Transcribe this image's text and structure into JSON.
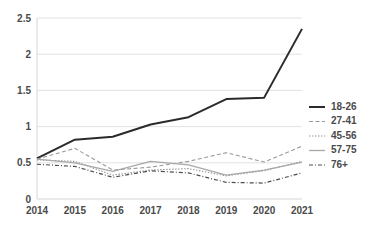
{
  "chart_data": {
    "type": "line",
    "title": "",
    "subtitle": "",
    "xlabel": "",
    "ylabel": "",
    "categories": [
      "2014",
      "2015",
      "2016",
      "2017",
      "2018",
      "2019",
      "2020",
      "2021"
    ],
    "x": [
      2014,
      2015,
      2016,
      2017,
      2018,
      2019,
      2020,
      2021
    ],
    "ylim": [
      0,
      2.5
    ],
    "yticks": [
      "0",
      "0.5",
      "1",
      "1.5",
      "2",
      "2.5"
    ],
    "ytick_values": [
      0,
      0.5,
      1,
      1.5,
      2,
      2.5
    ],
    "grid": true,
    "legend_position": "right",
    "series": [
      {
        "name": "18-26",
        "values": [
          0.56,
          0.82,
          0.86,
          1.03,
          1.13,
          1.38,
          1.4,
          2.35
        ],
        "color": "#2b2b2b",
        "width": 2.0,
        "dash": "none"
      },
      {
        "name": "27-41",
        "values": [
          0.55,
          0.7,
          0.4,
          0.44,
          0.52,
          0.64,
          0.51,
          0.73
        ],
        "color": "#9a9a9a",
        "width": 1.1,
        "dash": "4,2.5"
      },
      {
        "name": "45-56",
        "values": [
          0.54,
          0.52,
          0.33,
          0.4,
          0.42,
          0.32,
          0.39,
          0.52
        ],
        "color": "#8f8f8f",
        "width": 1.1,
        "dash": "1.4,1.6"
      },
      {
        "name": "57-75",
        "values": [
          0.55,
          0.5,
          0.38,
          0.52,
          0.47,
          0.33,
          0.4,
          0.51
        ],
        "color": "#a8a8a8",
        "width": 1.3,
        "dash": "none"
      },
      {
        "name": "76+",
        "values": [
          0.48,
          0.45,
          0.3,
          0.39,
          0.36,
          0.23,
          0.22,
          0.36
        ],
        "color": "#4d4d4d",
        "width": 1.2,
        "dash": "4,2,1,2"
      }
    ]
  },
  "legend": {
    "items": [
      {
        "label": "18-26"
      },
      {
        "label": "27-41"
      },
      {
        "label": "45-56"
      },
      {
        "label": "57-75"
      },
      {
        "label": "76+"
      }
    ]
  }
}
